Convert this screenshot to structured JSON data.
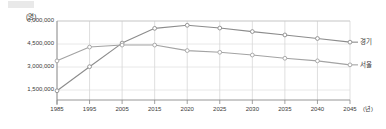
{
  "chart_data": {
    "type": "line",
    "title": "",
    "subtitle": "",
    "unit_label": "(명)",
    "xlabel": "(년)",
    "ylabel": "",
    "x": [
      1985,
      1995,
      2005,
      2015,
      2020,
      2025,
      2030,
      2035,
      2040,
      2045
    ],
    "xtick_labels": [
      "1985",
      "1995",
      "2005",
      "2015",
      "2020",
      "2025",
      "2030",
      "2035",
      "2040",
      "2045"
    ],
    "ytick_labels": [
      "1,500,000",
      "3,000,000",
      "4,500,000",
      "6,000,000"
    ],
    "yticks": [
      1500000,
      3000000,
      4500000,
      6000000
    ],
    "ylim": [
      0,
      6000000
    ],
    "xlim": [
      1985,
      2045
    ],
    "grid": true,
    "legend_position": "right-inline",
    "series": [
      {
        "name": "경기",
        "color": "#8c8c8c",
        "values": [
          1450000,
          3020000,
          4560000,
          5520000,
          5720000,
          5540000,
          5310000,
          5090000,
          4860000,
          4620000
        ]
      },
      {
        "name": "서울",
        "color": "#a3a3a3",
        "values": [
          3400000,
          4300000,
          4430000,
          4430000,
          4070000,
          3960000,
          3780000,
          3570000,
          3400000,
          3140000
        ]
      }
    ]
  },
  "axis": {
    "unit": "(명)",
    "x_unit": "(년)"
  },
  "legend": {
    "items": [
      {
        "label": "경기"
      },
      {
        "label": "서울"
      }
    ]
  }
}
